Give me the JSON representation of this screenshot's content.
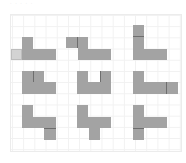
{
  "caption": "· · · · ·",
  "board": {
    "grid_cell_px": 11,
    "rows": 3,
    "cols": 3,
    "colors": {
      "shape": "#a3a3a3",
      "highlight": "#d3d3d3",
      "divider": "#6e6e6e",
      "gridline": "#f1f1f1"
    }
  },
  "panels": [
    {
      "id": "r1c1",
      "description": "L-shape with light highlighted cell to left of bar"
    },
    {
      "id": "r1c2",
      "description": "L-shape with extra square left of stem top"
    },
    {
      "id": "r1c3",
      "description": "L-shape with stem two cells tall"
    },
    {
      "id": "r2c1",
      "description": "L-shape with inner square right of stem"
    },
    {
      "id": "r2c2",
      "description": "U-shape: L-shape with square above bar end"
    },
    {
      "id": "r2c3",
      "description": "L-shape with square extending bar to right"
    },
    {
      "id": "r3c1",
      "description": "L-shape with square below bar right end"
    },
    {
      "id": "r3c2",
      "description": "L-shape with square below bar middle"
    },
    {
      "id": "r3c3",
      "description": "L-shape with square below stem"
    }
  ]
}
